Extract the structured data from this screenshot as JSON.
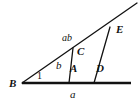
{
  "figure": {
    "kind": "geometry-diagram",
    "background_color": "#ffffff",
    "stroke_color": "#111111",
    "canvas": {
      "width": 140,
      "height": 105
    },
    "vertices": [
      {
        "id": "B",
        "label": "B",
        "x": 22,
        "y": 83,
        "label_x": 9,
        "label_y": 78
      },
      {
        "id": "C",
        "label": "C",
        "x": 73,
        "y": 48,
        "label_x": 77,
        "label_y": 46
      },
      {
        "id": "E",
        "label": "E",
        "x": 110,
        "y": 27,
        "label_x": 116,
        "label_y": 24
      },
      {
        "id": "A",
        "label": "A",
        "x": 69,
        "y": 83,
        "label_x": 70,
        "label_y": 63
      },
      {
        "id": "D",
        "label": "D",
        "x": 94,
        "y": 83,
        "label_x": 96,
        "label_y": 63
      }
    ],
    "segment_labels": [
      {
        "id": "a",
        "label": "a",
        "x": 70,
        "y": 89
      },
      {
        "id": "b",
        "label": "b",
        "x": 56,
        "y": 60
      },
      {
        "id": "ab",
        "label": "ab",
        "x": 62,
        "y": 33
      }
    ],
    "angle_labels": [
      {
        "id": "angle-1",
        "label": "1",
        "x": 37,
        "y": 71
      }
    ],
    "lines": [
      {
        "id": "baseline",
        "x1": 22,
        "y1": 83,
        "x2": 131,
        "y2": 83,
        "width": 2.4
      },
      {
        "id": "ray-B-through-E",
        "x1": 22,
        "y1": 83,
        "x2": 137,
        "y2": 3,
        "width": 1.3
      },
      {
        "id": "segment-C-A",
        "x1": 73,
        "y1": 48,
        "x2": 69,
        "y2": 83,
        "width": 1.3
      },
      {
        "id": "segment-E-D",
        "x1": 110,
        "y1": 27,
        "x2": 94,
        "y2": 83,
        "width": 1.3
      },
      {
        "id": "segment-C-E",
        "x1": 73,
        "y1": 48,
        "x2": 110,
        "y2": 27,
        "width": 1.3
      }
    ]
  }
}
